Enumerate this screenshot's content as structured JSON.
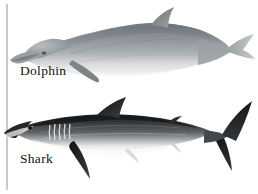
{
  "figure": {
    "background_color": "#ffffff",
    "margin_rule_color": "#c9c9c9",
    "label_color": "#111111"
  },
  "panels": [
    {
      "id": "dolphin",
      "label": "Dolphin",
      "subject": "dolphin-illustration",
      "description": "Grey airbrushed side view of a dolphin facing left, with long beak, curved dorsal fin, pectoral flipper and horizontal tail flukes",
      "body_color": "#8f9499",
      "belly_color": "#ededea",
      "outline_color": "#6d7277",
      "orientation": "facing-left"
    },
    {
      "id": "shark",
      "label": "Shark",
      "subject": "shark-illustration",
      "description": "High contrast dark grey side view of a shark facing left, with pointed snout, five gill slits, tall triangular dorsal fin, long pectoral fin and asymmetrical vertical tail",
      "body_color": "#3a3d40",
      "belly_color": "#f2f2f0",
      "outline_color": "#16181a",
      "orientation": "facing-left"
    }
  ]
}
